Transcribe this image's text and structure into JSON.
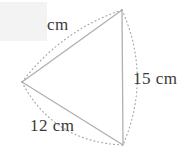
{
  "figure": {
    "type": "geometry-diagram",
    "shape": "triangle",
    "canvas": {
      "width": 186,
      "height": 159,
      "background": "#ffffff"
    },
    "colors": {
      "edge_stroke": "#b0b0b0",
      "arc_stroke": "#a9a9a9",
      "label_text": "#3a3a3a",
      "mask_fill": "#f3f3f3"
    },
    "vertices": [
      {
        "name": "left",
        "x": 22,
        "y": 82
      },
      {
        "name": "top",
        "x": 122,
        "y": 10
      },
      {
        "name": "bottom",
        "x": 123,
        "y": 145
      }
    ],
    "edges": [
      {
        "name": "upper-left-edge",
        "from": "left",
        "to": "top",
        "label_ref": "top"
      },
      {
        "name": "right-edge",
        "from": "top",
        "to": "bottom",
        "label_ref": "right"
      },
      {
        "name": "lower-left-edge",
        "from": "left",
        "to": "bottom",
        "label_ref": "bottom"
      }
    ],
    "labels": {
      "top": {
        "value": "",
        "unit": "cm",
        "text": "cm",
        "note": "numeric value is covered by blank box"
      },
      "right": {
        "value": "15",
        "unit": "cm",
        "text": "15 cm"
      },
      "bottom": {
        "value": "12",
        "unit": "cm",
        "text": "12 cm"
      }
    },
    "mask": {
      "name": "blank-box",
      "x": 0,
      "y": 2,
      "width": 47,
      "height": 39
    }
  }
}
